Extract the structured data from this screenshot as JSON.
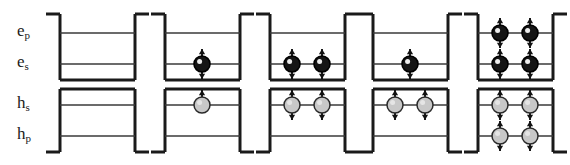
{
  "figure": {
    "width": 570,
    "height": 165,
    "background": "#ffffff"
  },
  "colors": {
    "well_stroke": "#1a1a1a",
    "level_stroke": "#3a3a3a",
    "electron_fill": "#151515",
    "electron_stroke": "#000000",
    "hole_fill": "#c8c8c8",
    "hole_stroke": "#2a2a2a",
    "arrow_stroke": "#111111",
    "label_color": "#1a1a1a"
  },
  "labels": {
    "electron_p": {
      "base": "e",
      "sub": "p",
      "text": "ep"
    },
    "electron_s": {
      "base": "e",
      "sub": "s",
      "text": "es"
    },
    "hole_s": {
      "base": "h",
      "sub": "s",
      "text": "hs"
    },
    "hole_p": {
      "base": "h",
      "sub": "p",
      "text": "hp"
    }
  },
  "geometry": {
    "panel_x": [
      60,
      165,
      270,
      373,
      478
    ],
    "panel_width": 75,
    "rim_overhang": 14,
    "electron_well": {
      "top": 14,
      "bottom": 80,
      "p_level": 33,
      "s_level": 64
    },
    "hole_well": {
      "top": 89,
      "bottom": 152,
      "s_level": 105,
      "p_level": 136
    },
    "particle_radius": 8,
    "arrow_length": 13,
    "slot_offsets": [
      22,
      52
    ],
    "single_slot_offset": 37
  },
  "panels": [
    {
      "id": "panel-1",
      "name": "empty-dot",
      "electron_p": [],
      "electron_s": [],
      "hole_s": [],
      "hole_p": []
    },
    {
      "id": "panel-2",
      "name": "single-exciton",
      "electron_p": [],
      "electron_s": [
        {
          "slot": 1,
          "spin": "updown"
        }
      ],
      "hole_s": [
        {
          "slot": 1,
          "spin": "up"
        }
      ],
      "hole_p": []
    },
    {
      "id": "panel-3",
      "name": "biexciton",
      "electron_p": [],
      "electron_s": [
        {
          "slot": 0,
          "spin": "updown"
        },
        {
          "slot": 1,
          "spin": "updown"
        }
      ],
      "hole_s": [
        {
          "slot": 0,
          "spin": "updown"
        },
        {
          "slot": 1,
          "spin": "updown"
        }
      ],
      "hole_p": []
    },
    {
      "id": "panel-4",
      "name": "positive-trion",
      "electron_p": [],
      "electron_s": [
        {
          "slot": 1,
          "spin": "updown"
        }
      ],
      "hole_s": [
        {
          "slot": 0,
          "spin": "updown"
        },
        {
          "slot": 1,
          "spin": "updown"
        }
      ],
      "hole_p": []
    },
    {
      "id": "panel-5",
      "name": "filled-s-and-p-shells",
      "electron_p": [
        {
          "slot": 0,
          "spin": "updown"
        },
        {
          "slot": 1,
          "spin": "updown"
        }
      ],
      "electron_s": [
        {
          "slot": 0,
          "spin": "updown"
        },
        {
          "slot": 1,
          "spin": "updown"
        }
      ],
      "hole_s": [
        {
          "slot": 0,
          "spin": "updown"
        },
        {
          "slot": 1,
          "spin": "updown"
        }
      ],
      "hole_p": [
        {
          "slot": 0,
          "spin": "updown"
        },
        {
          "slot": 1,
          "spin": "updown"
        }
      ]
    }
  ]
}
